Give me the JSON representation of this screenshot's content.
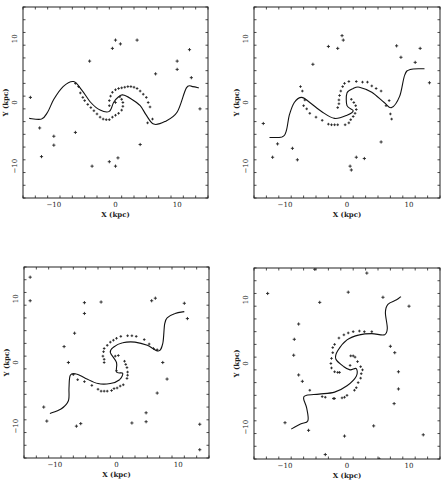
{
  "figure": {
    "panel_count": 4,
    "layout": "2x2"
  },
  "chart_data": [
    {
      "type": "scatter",
      "panel": "top-left",
      "xlabel": "X (kpc)",
      "ylabel": "Y (kpc)",
      "xlim": [
        -15,
        15
      ],
      "ylim": [
        -15,
        15
      ],
      "xticks": [
        -10,
        0,
        10
      ],
      "yticks": [
        -10,
        0,
        10
      ],
      "grid": false,
      "curve": [
        [
          -14,
          -2.5
        ],
        [
          -12,
          -2.6
        ],
        [
          -11,
          -1.5
        ],
        [
          -10,
          0.5
        ],
        [
          -8.5,
          2.5
        ],
        [
          -6.8,
          3.3
        ],
        [
          -5.5,
          2
        ],
        [
          -4,
          0
        ],
        [
          -2.5,
          -1.2
        ],
        [
          -1,
          -1.4
        ],
        [
          -0.3,
          0
        ],
        [
          0.5,
          0.9
        ],
        [
          1.2,
          1.2
        ],
        [
          2.5,
          0.6
        ],
        [
          4,
          -0.5
        ],
        [
          5,
          -2
        ],
        [
          6.2,
          -3.4
        ],
        [
          8,
          -3
        ],
        [
          10,
          -1.5
        ],
        [
          11.5,
          2.3
        ],
        [
          12.5,
          2.5
        ],
        [
          13.5,
          2.3
        ]
      ],
      "arm_points": [
        [
          -6.5,
          3
        ],
        [
          -6,
          2.5
        ],
        [
          -5.7,
          1.5
        ],
        [
          -5.3,
          0.8
        ],
        [
          -5,
          0.3
        ],
        [
          -4.5,
          -0.3
        ],
        [
          -4,
          -0.8
        ],
        [
          -3.5,
          -1.3
        ],
        [
          -3,
          -1.8
        ],
        [
          -2.5,
          -2.3
        ],
        [
          -2,
          -2.6
        ],
        [
          -1.5,
          -2.7
        ],
        [
          -1,
          -2.7
        ],
        [
          -0.5,
          -2.3
        ],
        [
          0,
          -2
        ],
        [
          0.5,
          -1.7
        ],
        [
          1,
          -1.2
        ],
        [
          1.2,
          -0.6
        ],
        [
          1.2,
          0
        ],
        [
          1,
          0.5
        ],
        [
          0.7,
          0.9
        ],
        [
          -1,
          -0.5
        ],
        [
          -1,
          0.3
        ],
        [
          -0.8,
          1
        ],
        [
          -0.5,
          1.6
        ],
        [
          0,
          2
        ],
        [
          0.5,
          2.2
        ],
        [
          1,
          2.3
        ],
        [
          1.5,
          2.4
        ],
        [
          2,
          2.5
        ],
        [
          2.5,
          2.5
        ],
        [
          3,
          2.4
        ],
        [
          3.5,
          2.2
        ],
        [
          4,
          1.8
        ],
        [
          4.5,
          1.3
        ],
        [
          5,
          0.8
        ],
        [
          5.3,
          0
        ],
        [
          5.6,
          -0.7
        ],
        [
          6,
          -2.6
        ],
        [
          5.2,
          -3.2
        ],
        [
          0,
          0
        ]
      ],
      "field_points": [
        [
          -13.8,
          0.8
        ],
        [
          -12.3,
          -4
        ],
        [
          -12,
          -8.5
        ],
        [
          -10,
          -5.3
        ],
        [
          -10,
          -6.7
        ],
        [
          -4.2,
          6.5
        ],
        [
          -3.8,
          -10
        ],
        [
          -6.5,
          -4.7
        ],
        [
          -0.5,
          8.5
        ],
        [
          0,
          9.8
        ],
        [
          0.8,
          9.2
        ],
        [
          3.5,
          9.8
        ],
        [
          6.5,
          4.5
        ],
        [
          10,
          6.5
        ],
        [
          10,
          5.2
        ],
        [
          12,
          8.3
        ],
        [
          12.3,
          3.9
        ],
        [
          13.7,
          -1
        ],
        [
          4,
          -6.6
        ],
        [
          -1,
          -9.3
        ],
        [
          0,
          -10
        ],
        [
          0.4,
          -8.7
        ]
      ]
    },
    {
      "type": "scatter",
      "panel": "top-right",
      "xlabel": "X (kpc)",
      "ylabel": "Y (kpc)",
      "xlim": [
        -15,
        15
      ],
      "ylim": [
        -15,
        15
      ],
      "xticks": [
        -10,
        0,
        10
      ],
      "yticks": [
        -10,
        0,
        10
      ],
      "grid": false,
      "curve": [
        [
          -12.5,
          -5.5
        ],
        [
          -10.5,
          -5.4
        ],
        [
          -9.8,
          -4.5
        ],
        [
          -9.3,
          -2
        ],
        [
          -8.5,
          0
        ],
        [
          -7.3,
          0.8
        ],
        [
          -6,
          0
        ],
        [
          -4,
          -1.5
        ],
        [
          -2,
          -2.5
        ],
        [
          0,
          -2
        ],
        [
          1,
          -1.3
        ],
        [
          0,
          -0.5
        ],
        [
          0,
          1.5
        ],
        [
          1,
          2.2
        ],
        [
          2,
          2.4
        ],
        [
          4,
          1.6
        ],
        [
          6,
          0
        ],
        [
          7.2,
          -0.8
        ],
        [
          8.5,
          1
        ],
        [
          9.3,
          4.3
        ],
        [
          10.2,
          5.2
        ],
        [
          12.5,
          5.3
        ]
      ],
      "arm_points": [
        [
          -7.5,
          2.5
        ],
        [
          -7.2,
          1.8
        ],
        [
          -6.8,
          0.4
        ],
        [
          -7,
          -0.5
        ],
        [
          -6.5,
          -1
        ],
        [
          -6,
          -1.7
        ],
        [
          -5,
          -2.3
        ],
        [
          -4,
          -2.8
        ],
        [
          -3,
          -3.4
        ],
        [
          -2.5,
          -3.5
        ],
        [
          -2,
          -3.5
        ],
        [
          -1.5,
          -3.5
        ],
        [
          -0.3,
          -3.5
        ],
        [
          0.3,
          -3.2
        ],
        [
          0.6,
          -2.7
        ],
        [
          1,
          -2.2
        ],
        [
          1.3,
          -1.7
        ],
        [
          1.5,
          -1.1
        ],
        [
          1.4,
          -0.5
        ],
        [
          1.1,
          0
        ],
        [
          0.7,
          0.5
        ],
        [
          -1.5,
          -0.8
        ],
        [
          -1.3,
          -0.2
        ],
        [
          -1.3,
          0.4
        ],
        [
          -1.2,
          1.1
        ],
        [
          -1,
          1.8
        ],
        [
          -0.7,
          2.5
        ],
        [
          -0.4,
          3
        ],
        [
          0.3,
          3.3
        ],
        [
          1.5,
          3.3
        ],
        [
          2.5,
          3.2
        ],
        [
          3.3,
          3.2
        ],
        [
          4,
          2.6
        ],
        [
          4.7,
          2.2
        ],
        [
          5.5,
          1.8
        ],
        [
          6.3,
          -0.5
        ],
        [
          7,
          -1.8
        ],
        [
          7.2,
          -2.6
        ],
        [
          6.8,
          0.3
        ]
      ],
      "field_points": [
        [
          -13.5,
          -3.3
        ],
        [
          -11.2,
          -6.5
        ],
        [
          -12,
          -8.6
        ],
        [
          -8.8,
          -7.2
        ],
        [
          -8,
          -9
        ],
        [
          -5.5,
          6
        ],
        [
          -3,
          8.8
        ],
        [
          -1.5,
          8.5
        ],
        [
          -0.8,
          10.5
        ],
        [
          -0.6,
          9.8
        ],
        [
          0.5,
          -10
        ],
        [
          0.7,
          -10.6
        ],
        [
          1.5,
          -8.6
        ],
        [
          2.8,
          -8.8
        ],
        [
          5.5,
          -6.2
        ],
        [
          8,
          8.9
        ],
        [
          8.7,
          7.1
        ],
        [
          11,
          6.3
        ],
        [
          11.8,
          8.5
        ],
        [
          13.3,
          3.1
        ]
      ]
    },
    {
      "type": "scatter",
      "panel": "bottom-left",
      "xlabel": "X (kpc)",
      "ylabel": "Y (kpc)",
      "xlim": [
        -15,
        15
      ],
      "ylim": [
        -15,
        15
      ],
      "xticks": [
        -10,
        0,
        10
      ],
      "yticks": [
        -10,
        0,
        10
      ],
      "grid": false,
      "curve": [
        [
          -10.8,
          -8
        ],
        [
          -9,
          -7.3
        ],
        [
          -7.8,
          -6
        ],
        [
          -7.7,
          -4
        ],
        [
          -7.5,
          -2
        ],
        [
          -6.5,
          -1.8
        ],
        [
          -5,
          -2.5
        ],
        [
          -3,
          -3.3
        ],
        [
          -1,
          -3.3
        ],
        [
          0.5,
          -2.7
        ],
        [
          1,
          -1.7
        ],
        [
          0,
          -1.5
        ],
        [
          0,
          0
        ],
        [
          -1,
          1.6
        ],
        [
          -0.5,
          2.4
        ],
        [
          1,
          3.1
        ],
        [
          3,
          3.2
        ],
        [
          5,
          2.7
        ],
        [
          6.8,
          1.8
        ],
        [
          7.5,
          3
        ],
        [
          7.8,
          6
        ],
        [
          8.2,
          7
        ],
        [
          9.5,
          7.7
        ],
        [
          11,
          8
        ]
      ],
      "arm_points": [
        [
          -7,
          -1.9
        ],
        [
          -6.3,
          -2.7
        ],
        [
          -5.2,
          -3
        ],
        [
          -4,
          -3.6
        ],
        [
          -3,
          -4.2
        ],
        [
          -2.5,
          -4.5
        ],
        [
          -2,
          -4.5
        ],
        [
          -1.5,
          -4.5
        ],
        [
          -0.8,
          -4.4
        ],
        [
          -0.4,
          -4.1
        ],
        [
          0.1,
          -4
        ],
        [
          0.6,
          -3.7
        ],
        [
          1.1,
          -3.5
        ],
        [
          1.7,
          -2.5
        ],
        [
          1.8,
          -2
        ],
        [
          1.8,
          -1.5
        ],
        [
          1.7,
          -0.8
        ],
        [
          1.5,
          -0.3
        ],
        [
          1.3,
          0.2
        ],
        [
          -2,
          0
        ],
        [
          -2,
          0.5
        ],
        [
          -2.2,
          1
        ],
        [
          -2.1,
          1.7
        ],
        [
          -2,
          2.2
        ],
        [
          -1.5,
          2.7
        ],
        [
          -1,
          3.2
        ],
        [
          -0.5,
          3.5
        ],
        [
          0,
          3.8
        ],
        [
          0.7,
          4.1
        ],
        [
          1.8,
          4.2
        ],
        [
          2.5,
          4.2
        ],
        [
          3.2,
          4.1
        ],
        [
          4.5,
          3.6
        ],
        [
          5.3,
          2.9
        ],
        [
          6,
          2.2
        ],
        [
          6.6,
          2
        ],
        [
          0,
          -1.3
        ],
        [
          -0.2,
          1
        ],
        [
          0.3,
          1.1
        ]
      ],
      "field_points": [
        [
          -14,
          13.4
        ],
        [
          -14,
          9.7
        ],
        [
          -5.2,
          9.4
        ],
        [
          -5.2,
          7.7
        ],
        [
          -2.5,
          9.5
        ],
        [
          -6.8,
          4.6
        ],
        [
          -8.5,
          2.5
        ],
        [
          -7.8,
          0
        ],
        [
          -11.8,
          -7
        ],
        [
          -11.3,
          -9.2
        ],
        [
          -6.5,
          -10
        ],
        [
          -5.8,
          -9.6
        ],
        [
          2.5,
          -9.5
        ],
        [
          4.8,
          -7.9
        ],
        [
          4.8,
          -9.3
        ],
        [
          6.6,
          -4.8
        ],
        [
          7.5,
          0
        ],
        [
          8.2,
          -2.6
        ],
        [
          5.7,
          9.7
        ],
        [
          6.3,
          10.1
        ],
        [
          11,
          9.3
        ],
        [
          11.5,
          6.9
        ],
        [
          13.5,
          -9.7
        ],
        [
          13.5,
          -13.7
        ]
      ]
    },
    {
      "type": "scatter",
      "panel": "bottom-right",
      "xlabel": "X (kpc)",
      "ylabel": "Y (kpc)",
      "xlim": [
        -15,
        15
      ],
      "ylim": [
        -15,
        15
      ],
      "xticks": [
        -10,
        0,
        10
      ],
      "yticks": [
        -10,
        0,
        10
      ],
      "grid": false,
      "curve": [
        [
          -9,
          -10.3
        ],
        [
          -7.5,
          -9.5
        ],
        [
          -6.3,
          -9
        ],
        [
          -6.5,
          -7
        ],
        [
          -7,
          -5.5
        ],
        [
          -6.5,
          -5
        ],
        [
          -4.5,
          -4.8
        ],
        [
          -2,
          -4.5
        ],
        [
          0,
          -3.5
        ],
        [
          1.5,
          -2
        ],
        [
          1.5,
          -0.8
        ],
        [
          0.5,
          -1
        ],
        [
          -0.5,
          -0.5
        ],
        [
          -1.8,
          0.7
        ],
        [
          -1.5,
          2
        ],
        [
          0,
          3.7
        ],
        [
          2,
          4.5
        ],
        [
          4,
          4.7
        ],
        [
          6,
          4.5
        ],
        [
          6.5,
          5.5
        ],
        [
          6.2,
          8
        ],
        [
          6.6,
          9.3
        ],
        [
          8,
          10
        ],
        [
          8.7,
          10.5
        ]
      ],
      "arm_points": [
        [
          -6,
          -4.2
        ],
        [
          -4,
          -5.2
        ],
        [
          -3.5,
          -5.3
        ],
        [
          -2.2,
          -5.5
        ],
        [
          -2,
          -5.5
        ],
        [
          -0.8,
          -5.4
        ],
        [
          -0.4,
          -5.3
        ],
        [
          0,
          -5
        ],
        [
          1.2,
          -4.2
        ],
        [
          1.5,
          -3.8
        ],
        [
          1.8,
          -3
        ],
        [
          2.2,
          -2.3
        ],
        [
          2.3,
          -1.6
        ],
        [
          2.5,
          -1
        ],
        [
          2.2,
          -0.5
        ],
        [
          1.7,
          0.3
        ],
        [
          1.3,
          1
        ],
        [
          0.6,
          1.2
        ],
        [
          1,
          1.2
        ],
        [
          -1.2,
          -1.4
        ],
        [
          -1.5,
          -1.4
        ],
        [
          -2,
          -1.3
        ],
        [
          -2.5,
          -0.7
        ],
        [
          -2.6,
          0
        ],
        [
          -2.5,
          0.8
        ],
        [
          -2.3,
          1.7
        ],
        [
          -2.3,
          2.5
        ],
        [
          -2,
          3
        ],
        [
          -1.3,
          4
        ],
        [
          -0.5,
          4.5
        ],
        [
          0.2,
          4.8
        ],
        [
          1,
          5
        ],
        [
          2,
          5.1
        ],
        [
          2.8,
          5
        ],
        [
          4,
          5
        ],
        [
          0.5,
          -0.3
        ]
      ],
      "field_points": [
        [
          -12.8,
          11
        ],
        [
          -5.2,
          14.8
        ],
        [
          -4.4,
          9.6
        ],
        [
          -7.8,
          6.2
        ],
        [
          -8.5,
          3.8
        ],
        [
          -8.6,
          1.3
        ],
        [
          -7.8,
          -1.8
        ],
        [
          -7.2,
          -2.8
        ],
        [
          -10,
          -9.3
        ],
        [
          -6.2,
          -10.5
        ],
        [
          -0.4,
          -11.4
        ],
        [
          -3.5,
          -14.3
        ],
        [
          4.3,
          -9.8
        ],
        [
          5.2,
          -15
        ],
        [
          3.2,
          14.2
        ],
        [
          0.2,
          11.2
        ],
        [
          5.8,
          10.4
        ],
        [
          10,
          9
        ],
        [
          7,
          2.7
        ],
        [
          7.7,
          1.7
        ],
        [
          8.3,
          -1.3
        ],
        [
          8.3,
          -4
        ],
        [
          7.6,
          -6.3
        ],
        [
          12.3,
          -11.2
        ]
      ]
    }
  ]
}
